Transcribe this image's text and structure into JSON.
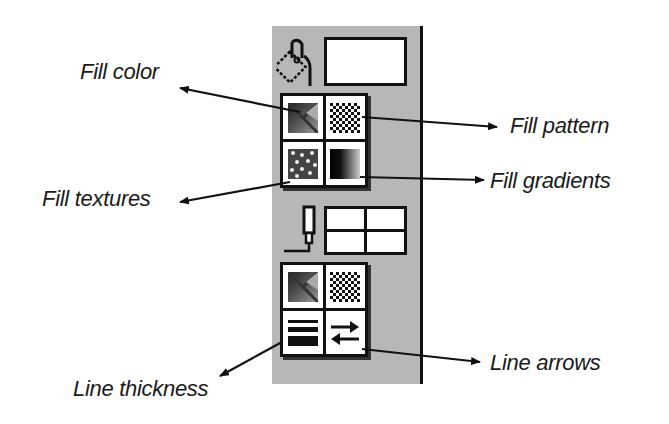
{
  "labels": {
    "fill_color": "Fill color",
    "fill_pattern": "Fill pattern",
    "fill_textures": "Fill textures",
    "fill_gradients": "Fill gradients",
    "line_thickness": "Line thickness",
    "line_arrows": "Line arrows"
  },
  "panel": {
    "background": "#b7b7b7",
    "fill_section": {
      "tool_icon": "paint-bucket-icon",
      "current_fill_swatch": "#ffffff",
      "buttons": [
        "fill-color",
        "fill-pattern",
        "fill-textures",
        "fill-gradients"
      ]
    },
    "line_section": {
      "tool_icon": "pen-icon",
      "current_line_swatch": "2x2 grid",
      "buttons": [
        "line-color",
        "line-pattern",
        "line-thickness",
        "line-arrows"
      ]
    }
  }
}
